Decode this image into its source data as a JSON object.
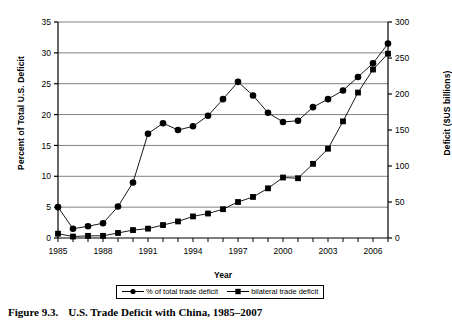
{
  "figure": {
    "caption_number": "Figure 9.3.",
    "caption_text": "U.S. Trade Deficit with China, 1985–2007"
  },
  "chart_data": {
    "type": "line",
    "title": "",
    "xlabel": "Year",
    "ylabel": "Percent of Total U.S. Deficit",
    "y2label": "Deficit ($US billions)",
    "x": [
      1985,
      1986,
      1987,
      1988,
      1989,
      1990,
      1991,
      1992,
      1993,
      1994,
      1995,
      1996,
      1997,
      1998,
      1999,
      2000,
      2001,
      2002,
      2003,
      2004,
      2005,
      2006,
      2007
    ],
    "xlim": [
      1985,
      2007
    ],
    "xticks": [
      1985,
      1988,
      1991,
      1994,
      1997,
      2000,
      2003,
      2006
    ],
    "xticklabels": [
      "1985",
      "1988",
      "1991",
      "1994",
      "1997",
      "2000",
      "2003",
      "2006"
    ],
    "ylim": [
      0,
      35
    ],
    "yticks": [
      0,
      5,
      10,
      15,
      20,
      25,
      30,
      35
    ],
    "yticklabels": [
      "0",
      "5",
      "10",
      "15",
      "20",
      "25",
      "30",
      "35"
    ],
    "y2lim": [
      0,
      300
    ],
    "y2ticks": [
      0,
      50,
      100,
      150,
      200,
      250,
      300
    ],
    "y2ticklabels": [
      "0",
      "50",
      "100",
      "150",
      "200",
      "250",
      "300"
    ],
    "grid": true,
    "legend_position": "below-axis",
    "series": [
      {
        "name": "% of total trade deficit",
        "axis": "left",
        "marker": "circle",
        "values": [
          5.0,
          1.5,
          1.9,
          2.4,
          5.1,
          9.0,
          16.9,
          18.6,
          17.5,
          18.1,
          19.8,
          22.5,
          25.3,
          23.1,
          20.3,
          18.8,
          19.0,
          21.2,
          22.5,
          23.9,
          26.1,
          28.3,
          31.5
        ]
      },
      {
        "name": "bilateral trade deficit",
        "axis": "right",
        "marker": "square",
        "values": [
          6,
          2,
          3,
          3,
          7,
          11,
          13,
          18,
          23,
          30,
          34,
          40,
          50,
          57,
          69,
          84,
          83,
          103,
          124,
          162,
          202,
          234,
          256
        ]
      }
    ]
  },
  "legend": {
    "items": [
      {
        "label": "% of total trade deficit",
        "marker": "circle"
      },
      {
        "label": "bilateral trade deficit",
        "marker": "square"
      }
    ]
  }
}
